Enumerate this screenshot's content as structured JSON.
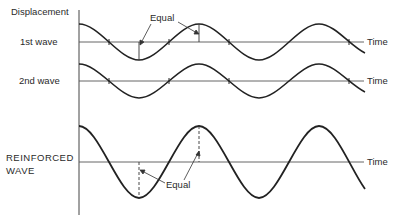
{
  "labels": {
    "y_axis": "Displacement",
    "wave1": "1st wave",
    "wave2": "2nd wave",
    "reinforced_line1": "REINFORCED",
    "reinforced_line2": "WAVE",
    "time1": "Time",
    "time2": "Time",
    "time3": "Time",
    "equal_top": "Equal",
    "equal_bottom": "Equal"
  },
  "waves": [
    {
      "name": "1st wave",
      "axis_y": 42,
      "amplitude": 18
    },
    {
      "name": "2nd wave",
      "axis_y": 81,
      "amplitude": 17
    },
    {
      "name": "Reinforced wave",
      "axis_y": 162,
      "amplitude": 36
    }
  ],
  "colors": {
    "line": "#222222",
    "axis": "#555555"
  }
}
